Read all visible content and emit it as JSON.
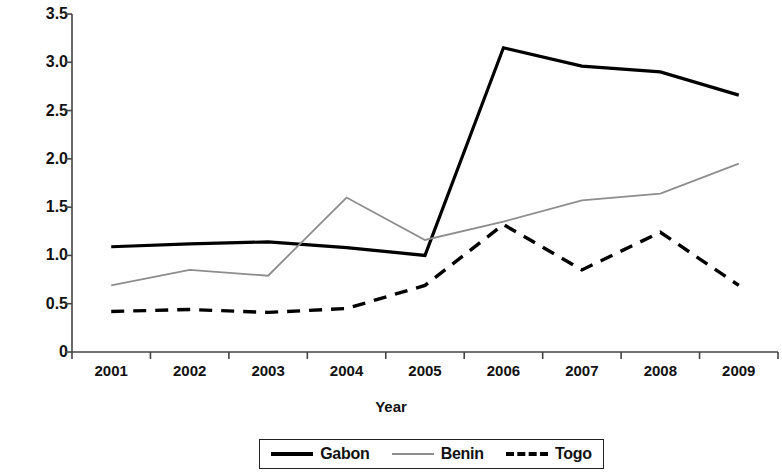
{
  "chart_data": {
    "type": "line",
    "title": "",
    "xlabel": "Year",
    "ylabel": "Cost recovery ratio",
    "categories": [
      "2001",
      "2002",
      "2003",
      "2004",
      "2005",
      "2006",
      "2007",
      "2008",
      "2009"
    ],
    "ylim": [
      0,
      3.5
    ],
    "ytick_labels": [
      "3.5",
      "3.0",
      "2.5",
      "2.0",
      "1.5",
      "1.0",
      "0.5",
      "0"
    ],
    "ytick_values": [
      3.5,
      3.0,
      2.5,
      2.0,
      1.5,
      1.0,
      0.5,
      0
    ],
    "grid": false,
    "legend_position": "bottom",
    "series": [
      {
        "name": "Gabon",
        "style": "solid",
        "color": "#000000",
        "width": 3.2,
        "values": [
          1.09,
          1.12,
          1.14,
          1.08,
          1.0,
          3.15,
          2.96,
          2.9,
          2.66
        ]
      },
      {
        "name": "Benin",
        "style": "solid",
        "color": "#8d8d8d",
        "width": 1.8,
        "values": [
          0.69,
          0.85,
          0.79,
          1.6,
          1.16,
          1.35,
          1.57,
          1.64,
          1.95
        ]
      },
      {
        "name": "Togo",
        "style": "dashed",
        "color": "#000000",
        "width": 3.4,
        "values": [
          0.42,
          0.44,
          0.41,
          0.45,
          0.69,
          1.32,
          0.85,
          1.24,
          0.69
        ]
      }
    ]
  },
  "legend": {
    "entries": [
      {
        "label": "Gabon"
      },
      {
        "label": "Benin"
      },
      {
        "label": "Togo"
      }
    ]
  }
}
